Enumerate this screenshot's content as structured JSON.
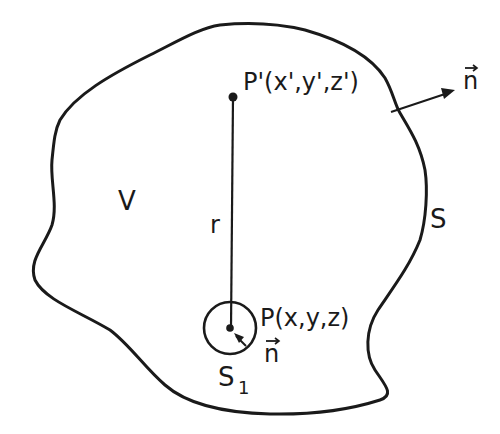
{
  "diagram": {
    "region_label": "V",
    "surface_label": "S",
    "small_surface_label": "S",
    "small_surface_subscript": "1",
    "distance_label": "r",
    "point_source_label": "P'(x',y',z')",
    "point_field_label": "P(x,y,z)",
    "normal_outer_label": "n",
    "normal_inner_label": "n",
    "colors": {
      "ink": "#1a1a1a",
      "background": "#ffffff"
    }
  }
}
